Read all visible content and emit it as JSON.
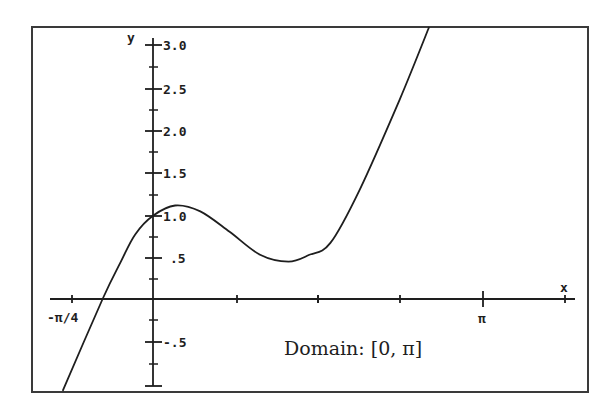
{
  "chart_data": {
    "type": "line",
    "title": "",
    "xlabel": "x",
    "ylabel": "y",
    "annotation": "Domain: [0, π]",
    "x_tick_labels": [
      "-π/4",
      "π"
    ],
    "x_ticks": [
      -0.785,
      0.785,
      1.571,
      2.356,
      3.142
    ],
    "y_tick_labels": [
      "3.0",
      "2.5",
      "2.0",
      "1.5",
      "1.0",
      ".5",
      "-.5"
    ],
    "y_ticks": [
      3.0,
      2.5,
      2.0,
      1.5,
      1.0,
      0.5,
      -0.5
    ],
    "xlim": [
      -0.98,
      3.9
    ],
    "ylim": [
      -1.0,
      3.2
    ],
    "grid": false,
    "legend": null,
    "series": [
      {
        "name": "f(x)",
        "x": [
          -0.86,
          -0.48,
          -0.31,
          -0.17,
          0.0,
          0.21,
          0.45,
          0.73,
          1.02,
          1.29,
          1.49,
          1.69,
          1.97,
          2.35,
          2.63
        ],
        "values": [
          -1.08,
          0.0,
          0.43,
          0.76,
          0.98,
          1.1,
          1.03,
          0.79,
          0.52,
          0.44,
          0.52,
          0.66,
          1.29,
          2.35,
          3.2
        ]
      }
    ]
  },
  "labels": {
    "y_axis": "y",
    "x_axis": "x",
    "domain_note": "Domain: [0, π]",
    "x_tick_neg_pi_4": "-π/4",
    "x_tick_pi": "π",
    "y_tick_3_0": "3.0",
    "y_tick_2_5": "2.5",
    "y_tick_2_0": "2.0",
    "y_tick_1_5": "1.5",
    "y_tick_1_0": "1.0",
    "y_tick_0_5": ".5",
    "y_tick_neg_0_5": "-.5"
  },
  "colors": {
    "ink": "#1e1e1e",
    "frame": "#3a3a3a",
    "background": "#ffffff"
  }
}
